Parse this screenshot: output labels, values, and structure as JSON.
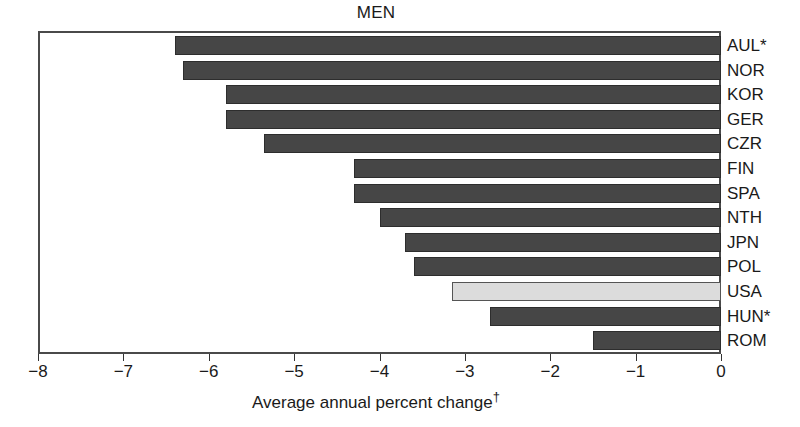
{
  "chart_data": {
    "type": "bar",
    "orientation": "horizontal",
    "title": "MEN",
    "xlabel": "Average annual percent change†",
    "ylabel": "",
    "xlim": [
      -8,
      0
    ],
    "xticks": [
      -8,
      -7,
      -6,
      -5,
      -4,
      -3,
      -2,
      -1,
      0
    ],
    "xticklabels": [
      "−8",
      "−7",
      "−6",
      "−5",
      "−4",
      "−3",
      "−2",
      "−1",
      "0"
    ],
    "grid": false,
    "legend": "none",
    "categories": [
      "AUL*",
      "NOR",
      "KOR",
      "GER",
      "CZR",
      "FIN",
      "SPA",
      "NTH",
      "JPN",
      "POL",
      "USA",
      "HUN*",
      "ROM"
    ],
    "values": [
      -6.4,
      -6.3,
      -5.8,
      -5.8,
      -5.35,
      -4.3,
      -4.3,
      -4.0,
      -3.7,
      -3.6,
      -3.15,
      -2.7,
      -1.5
    ],
    "highlight_category": "USA",
    "bars": [
      {
        "label": "AUL*",
        "value": -6.4,
        "highlight": false
      },
      {
        "label": "NOR",
        "value": -6.3,
        "highlight": false
      },
      {
        "label": "KOR",
        "value": -5.8,
        "highlight": false
      },
      {
        "label": "GER",
        "value": -5.8,
        "highlight": false
      },
      {
        "label": "CZR",
        "value": -5.35,
        "highlight": false
      },
      {
        "label": "FIN",
        "value": -4.3,
        "highlight": false
      },
      {
        "label": "SPA",
        "value": -4.3,
        "highlight": false
      },
      {
        "label": "NTH",
        "value": -4.0,
        "highlight": false
      },
      {
        "label": "JPN",
        "value": -3.7,
        "highlight": false
      },
      {
        "label": "POL",
        "value": -3.6,
        "highlight": false
      },
      {
        "label": "USA",
        "value": -3.15,
        "highlight": true
      },
      {
        "label": "HUN*",
        "value": -2.7,
        "highlight": false
      },
      {
        "label": "ROM",
        "value": -1.5,
        "highlight": false
      }
    ],
    "colors": {
      "bar": "#464646",
      "bar_border": "#2d2d2d",
      "highlight_bar": "#dcdcdc",
      "highlight_bar_border": "#555555",
      "frame": "#4a4a4a",
      "text": "#1a1a1a",
      "background": "#ffffff"
    }
  }
}
